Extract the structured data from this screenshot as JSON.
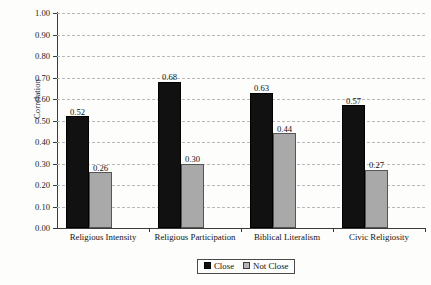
{
  "chart_data": {
    "type": "bar",
    "title": "",
    "xlabel": "",
    "ylabel": "Correlation",
    "ylim": [
      0.0,
      1.0
    ],
    "ytick_step": 0.1,
    "grid": true,
    "legend_position": "bottom-center",
    "categories": [
      "Religious Intensity",
      "Religious Participation",
      "Biblical Literalism",
      "Civic Religiosity"
    ],
    "series": [
      {
        "name": "Close",
        "values": [
          0.52,
          0.68,
          0.63,
          0.57
        ],
        "color": "#111111"
      },
      {
        "name": "Not Close",
        "values": [
          0.26,
          0.3,
          0.44,
          0.27
        ],
        "color": "#a9a9a9"
      }
    ],
    "ytick_labels": [
      "0.00",
      "0.10",
      "0.20",
      "0.30",
      "0.40",
      "0.50",
      "0.60",
      "0.70",
      "0.80",
      "0.90",
      "1.00"
    ],
    "value_labels": {
      "close": [
        "0.52",
        "0.68",
        "0.63",
        "0.57"
      ],
      "not_close": [
        "0.26",
        "0.30",
        "0.44",
        "0.27"
      ]
    }
  },
  "legend": {
    "items": [
      {
        "label": "Close"
      },
      {
        "label": "Not Close"
      }
    ]
  }
}
